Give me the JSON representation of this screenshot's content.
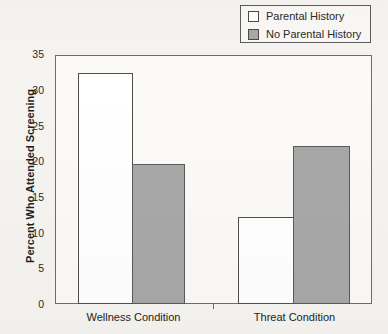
{
  "chart_data": {
    "type": "bar",
    "title": "",
    "xlabel": "",
    "ylabel": "Percent Who Attended Screening",
    "categories": [
      "Wellness Condition",
      "Threat Condition"
    ],
    "series": [
      {
        "name": "Parental History",
        "values": [
          32.3,
          12.2
        ],
        "color": "#ffffff"
      },
      {
        "name": "No Parental History",
        "values": [
          19.6,
          22.1
        ],
        "color": "#a8a8a8"
      }
    ],
    "ylim": [
      0,
      35
    ],
    "yticks": [
      0,
      5,
      10,
      15,
      20,
      25,
      30,
      35
    ],
    "ytick_labels": [
      "0",
      "5",
      "10",
      "15",
      "20",
      "25",
      "30",
      "35"
    ],
    "grid": false,
    "legend_position": "top-right"
  },
  "legend": {
    "items": [
      {
        "label": "Parental History",
        "swatch": "white-square-swatch"
      },
      {
        "label": "No Parental History",
        "swatch": "gray-square-swatch"
      }
    ]
  },
  "colors": {
    "bar_white": "#ffffff",
    "bar_gray": "#a8a8a8",
    "axis": "#6d6d6d",
    "text": "#2a2a2a",
    "background": "#f6f4f0"
  }
}
